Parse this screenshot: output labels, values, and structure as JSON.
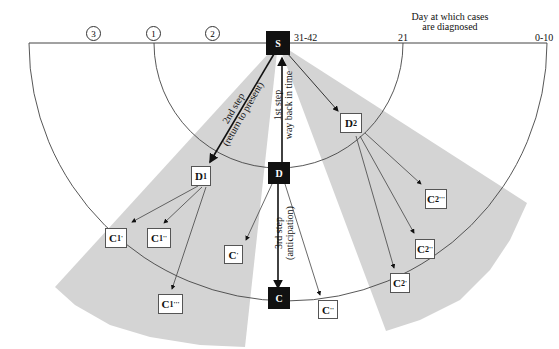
{
  "axis": {
    "title_line1": "Day at which cases",
    "title_line2": "are diagnosed",
    "ticks": [
      "31-42",
      "21",
      "0-10"
    ]
  },
  "generations": [
    "3",
    "1",
    "2"
  ],
  "nodes": {
    "S": "S",
    "D": "D",
    "C": "C",
    "D1": {
      "base": "D",
      "sub": "1"
    },
    "D2": {
      "base": "D",
      "sub": "2"
    },
    "C1p": {
      "base": "C",
      "sub": "1",
      "mark": "'"
    },
    "C1pp": {
      "base": "C",
      "sub": "1",
      "mark": "''"
    },
    "C1ppp": {
      "base": "C",
      "sub": "1",
      "mark": "'''"
    },
    "C2p": {
      "base": "C",
      "sub": "2",
      "mark": "'"
    },
    "C2pp": {
      "base": "C",
      "sub": "2",
      "mark": "''"
    },
    "C2ppp": {
      "base": "C",
      "sub": "2",
      "mark": "'''"
    },
    "Cp": {
      "base": "C",
      "mark": "'"
    },
    "Cpp": {
      "base": "C",
      "mark": "''"
    }
  },
  "steps": {
    "step1_line1": "1st step",
    "step1_line2": "way back in time",
    "step2_line1": "2nd step",
    "step2_line2": "(return to present)",
    "step3_line1": "3rd step",
    "step3_line2": "(anticipation)"
  },
  "colors": {
    "wedge": "#d4d4d4",
    "line": "#333333",
    "dark_box": "#111111"
  }
}
